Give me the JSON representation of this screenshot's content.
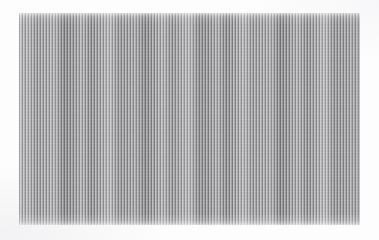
{
  "image": {
    "kind": "scanned-test-pattern",
    "description": "Rectangular block of fine vertical black-and-white stripes on a white page",
    "width_px": 379,
    "height_px": 240,
    "background_color": "#fdfdfd"
  },
  "pattern": {
    "name": "vertical-stripe-pattern",
    "orientation": "vertical",
    "stripe_period_px": 3,
    "approx_stripe_count": 114,
    "dark_color": "#6f6f71",
    "mid_color": "#9a9a9d",
    "light_color": "#d9d9dc",
    "has_moire_beating": "yes",
    "top_edge_fade": "yes",
    "bottom_edge_fade": "yes"
  },
  "panel": {
    "name": "stripe-panel",
    "left_px": 19,
    "top_px": 13,
    "width_px": 341,
    "height_px": 212,
    "right_px": 360,
    "bottom_px": 225
  }
}
